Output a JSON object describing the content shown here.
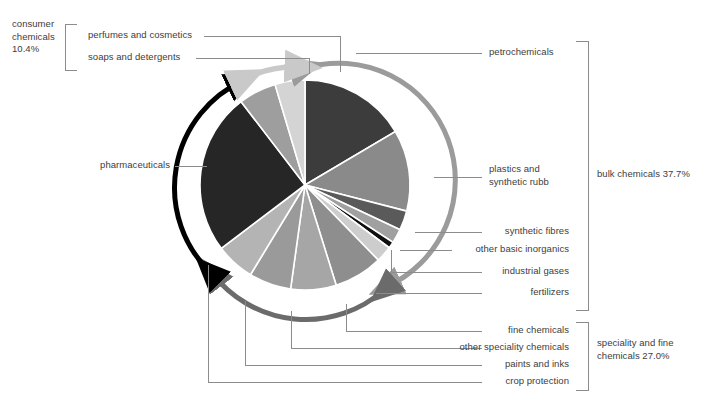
{
  "chart_data": {
    "type": "pie",
    "title": "",
    "subtitle": "",
    "xlabel": "",
    "ylabel": "",
    "grid": false,
    "legend_position": "callout-labels-with-brackets",
    "start_angle_deg": 0,
    "direction": "clockwise",
    "center_px": [
      305,
      185
    ],
    "radius_px": 105,
    "units": "percent",
    "total": 100.0,
    "groups": [
      {
        "name": "bulk chemicals",
        "value": 37.7,
        "label": "bulk chemicals 37.7%",
        "arc_color": "#9b9b9b"
      },
      {
        "name": "speciality and fine chemicals",
        "value": 27.0,
        "label": "speciality and fine\nchemicals 27.0%",
        "arc_color": "#6b6b6b"
      },
      {
        "name": "pharmaceuticals",
        "value": 24.9,
        "label": "pharmaceuticals",
        "arc_color": "#000000"
      },
      {
        "name": "consumer chemicals",
        "value": 10.4,
        "label": "consumer\nchemicals\n10.4%",
        "arc_color": "#c9c9c9"
      }
    ],
    "categories": [
      "petrochemicals",
      "plastics and synthetic rubb",
      "synthetic fibres",
      "other basic inorganics",
      "industrial gases",
      "fertilizers",
      "fine chemicals",
      "other speciality chemicals",
      "paints and inks",
      "crop protection",
      "pharmaceuticals",
      "soaps and detergents",
      "perfumes and cosmetics"
    ],
    "values": [
      16.5,
      12.5,
      3.0,
      2.2,
      1.0,
      2.5,
      7.5,
      7.0,
      6.5,
      6.0,
      24.9,
      5.8,
      4.6
    ],
    "slices": [
      {
        "name": "petrochemicals",
        "value": 16.5,
        "color": "#3c3c3c",
        "group": "bulk chemicals",
        "a0": 0.0,
        "a1": 59.4
      },
      {
        "name": "plastics and synthetic rubb",
        "value": 12.5,
        "color": "#8a8a8a",
        "group": "bulk chemicals",
        "a0": 59.4,
        "a1": 104.4
      },
      {
        "name": "synthetic fibres",
        "value": 3.0,
        "color": "#5a5a5a",
        "group": "bulk chemicals",
        "a0": 104.4,
        "a1": 115.2
      },
      {
        "name": "other basic inorganics",
        "value": 2.2,
        "color": "#a0a0a0",
        "group": "bulk chemicals",
        "a0": 115.2,
        "a1": 123.1
      },
      {
        "name": "industrial gases",
        "value": 1.0,
        "color": "#0f0f0f",
        "group": "bulk chemicals",
        "a0": 123.1,
        "a1": 126.7
      },
      {
        "name": "fertilizers",
        "value": 2.5,
        "color": "#cdcdcd",
        "group": "bulk chemicals",
        "a0": 126.7,
        "a1": 135.7
      },
      {
        "name": "fine chemicals",
        "value": 7.5,
        "color": "#8e8e8e",
        "group": "speciality and fine chemicals",
        "a0": 135.7,
        "a1": 162.7
      },
      {
        "name": "other speciality chemicals",
        "value": 7.0,
        "color": "#a6a6a6",
        "group": "speciality and fine chemicals",
        "a0": 162.7,
        "a1": 187.9
      },
      {
        "name": "paints and inks",
        "value": 6.5,
        "color": "#9a9a9a",
        "group": "speciality and fine chemicals",
        "a0": 187.9,
        "a1": 211.3
      },
      {
        "name": "crop protection",
        "value": 6.0,
        "color": "#b4b4b4",
        "group": "speciality and fine chemicals",
        "a0": 211.3,
        "a1": 232.9
      },
      {
        "name": "pharmaceuticals",
        "value": 24.9,
        "color": "#262626",
        "group": "pharmaceuticals",
        "a0": 232.9,
        "a1": 322.5
      },
      {
        "name": "soaps and detergents",
        "value": 5.8,
        "color": "#9e9e9e",
        "group": "consumer chemicals",
        "a0": 322.5,
        "a1": 343.4
      },
      {
        "name": "perfumes and cosmetics",
        "value": 4.6,
        "color": "#d4d4d4",
        "group": "consumer chemicals",
        "a0": 343.4,
        "a1": 360.0
      }
    ]
  },
  "labels": {
    "consumer_chemicals": "consumer\nchemicals\n10.4%",
    "perfumes_and_cosmetics": "perfumes and cosmetics",
    "soaps_and_detergents": "soaps and detergents",
    "pharmaceuticals": "pharmaceuticals",
    "petrochemicals": "petrochemicals",
    "plastics_and_synthetic_rubber": "plastics and\nsynthetic rubb",
    "synthetic_fibres": "synthetic fibres",
    "other_basic_inorganics": "other basic inorganics",
    "industrial_gases": "industrial gases",
    "fertilizers": "fertilizers",
    "fine_chemicals": "fine chemicals",
    "other_speciality_chemicals": "other speciality chemicals",
    "paints_and_inks": "paints and inks",
    "crop_protection": "crop protection",
    "bulk_chemicals": "bulk chemicals 37.7%",
    "speciality_and_fine_chemicals": "speciality and fine\nchemicals 27.0%"
  },
  "colors": {
    "text": "#3d3d3d",
    "leader_line": "#8c8c8c",
    "bracket": "#8c8c8c",
    "arc_bulk": "#9b9b9b",
    "arc_speciality": "#6b6b6b",
    "arc_pharma": "#000000",
    "arc_consumer": "#c9c9c9",
    "background": "#ffffff"
  }
}
